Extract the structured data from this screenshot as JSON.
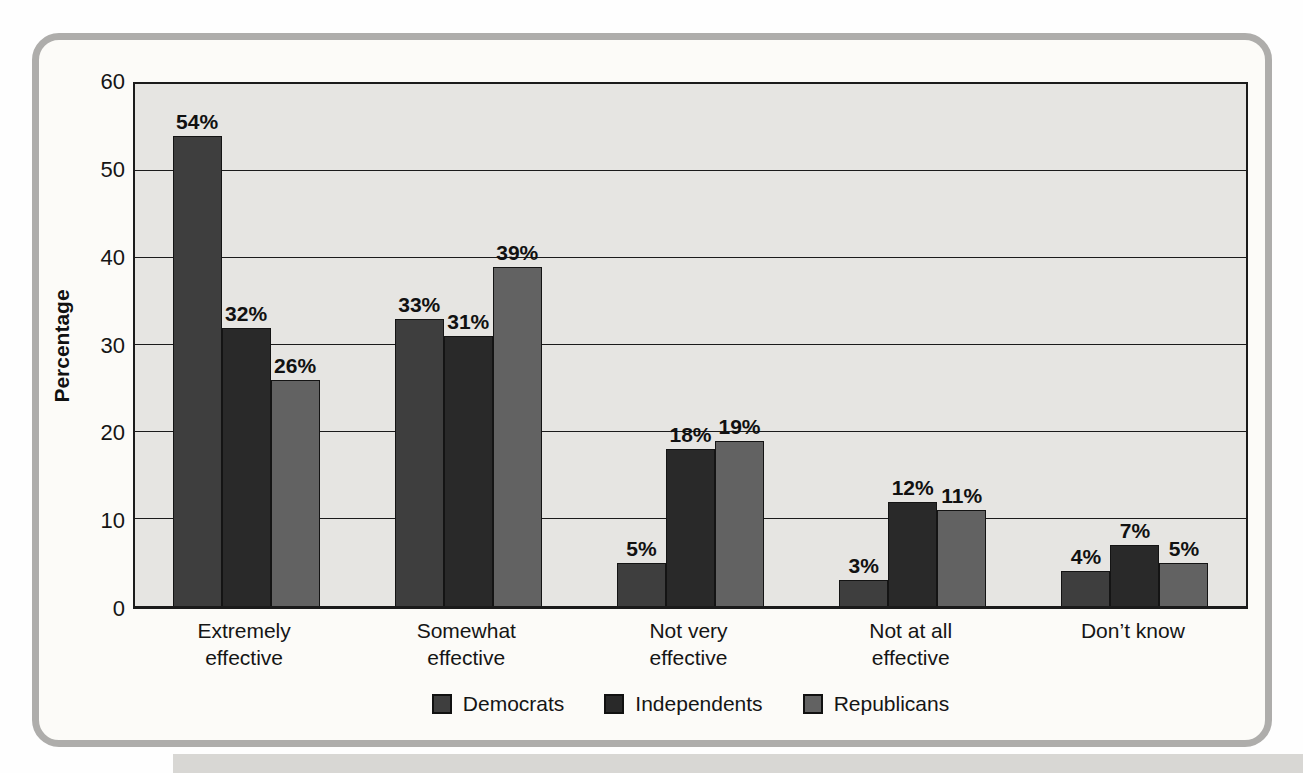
{
  "figure": {
    "frame_border_color": "#aeadab",
    "frame_background": "#fcfbf8",
    "plot_background": "#e6e5e2",
    "axis_color": "#1b1b1b"
  },
  "chart_data": {
    "type": "bar",
    "title": "",
    "xlabel": "",
    "ylabel": "Percentage",
    "ylim": [
      0,
      60
    ],
    "yticks": [
      0,
      10,
      20,
      30,
      40,
      50,
      60
    ],
    "grid": true,
    "legend_position": "bottom",
    "value_suffix": "%",
    "categories": [
      "Extremely effective",
      "Somewhat effective",
      "Not very effective",
      "Not at all effective",
      "Don’t know"
    ],
    "category_lines": [
      [
        "Extremely",
        "effective"
      ],
      [
        "Somewhat",
        "effective"
      ],
      [
        "Not very",
        "effective"
      ],
      [
        "Not at all",
        "effective"
      ],
      [
        "Don’t know"
      ]
    ],
    "series": [
      {
        "name": "Democrats",
        "color": "#3e3e3e",
        "values": [
          54,
          33,
          5,
          3,
          4
        ]
      },
      {
        "name": "Independents",
        "color": "#292929",
        "values": [
          32,
          31,
          18,
          12,
          7
        ]
      },
      {
        "name": "Republicans",
        "color": "#626262",
        "values": [
          26,
          39,
          19,
          11,
          5
        ]
      }
    ]
  }
}
